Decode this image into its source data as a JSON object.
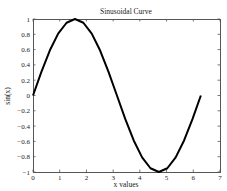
{
  "chart_data": {
    "type": "line",
    "title": "Sinusoidal Curve",
    "xlabel": "x values",
    "ylabel": "sin(x)",
    "xlim": [
      0,
      7
    ],
    "ylim": [
      -1,
      1
    ],
    "grid": false,
    "legend": null,
    "xticks": [
      0,
      1,
      2,
      3,
      4,
      5,
      6,
      7
    ],
    "yticks": [
      -1,
      -0.8,
      -0.6,
      -0.4,
      -0.2,
      0,
      0.2,
      0.4,
      0.6,
      0.8,
      1
    ],
    "xtick_labels": [
      "0",
      "1",
      "2",
      "3",
      "4",
      "5",
      "6",
      "7"
    ],
    "ytick_labels": [
      "−1",
      "−0.8",
      "−0.6",
      "−0.4",
      "−0.2",
      "0",
      "0.2",
      "0.4",
      "0.6",
      "0.8",
      "1"
    ],
    "series": [
      {
        "name": "sin(x)",
        "color": "#000000",
        "x": [
          0,
          0.314,
          0.628,
          0.942,
          1.257,
          1.571,
          1.885,
          2.199,
          2.513,
          2.827,
          3.142,
          3.456,
          3.77,
          4.084,
          4.398,
          4.712,
          5.027,
          5.341,
          5.655,
          5.969,
          6.283
        ],
        "y": [
          0,
          0.309,
          0.588,
          0.809,
          0.951,
          1.0,
          0.951,
          0.809,
          0.588,
          0.309,
          0,
          -0.309,
          -0.588,
          -0.809,
          -0.951,
          -1.0,
          -0.951,
          -0.809,
          -0.588,
          -0.309,
          0
        ]
      }
    ]
  },
  "layout": {
    "plot": {
      "left": 33,
      "top": 19,
      "right": 220,
      "bottom": 172
    }
  }
}
